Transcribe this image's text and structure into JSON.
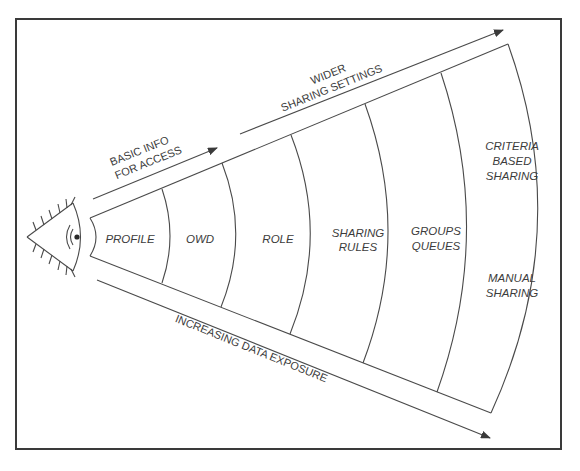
{
  "diagram": {
    "viewer_icon": "eye-icon",
    "top_arrows": [
      {
        "lines": [
          "BASIC INFO",
          "FOR ACCESS"
        ]
      },
      {
        "lines": [
          "WIDER",
          "SHARING SETTINGS"
        ]
      }
    ],
    "bottom_arrow": {
      "label": "INCREASING DATA EXPOSURE"
    },
    "segments": [
      {
        "id": "profile",
        "lines": [
          "PROFILE"
        ]
      },
      {
        "id": "owd",
        "lines": [
          "OWD"
        ]
      },
      {
        "id": "role",
        "lines": [
          "ROLE"
        ]
      },
      {
        "id": "sharing-rules",
        "lines": [
          "SHARING",
          "RULES"
        ]
      },
      {
        "id": "groups-queues",
        "lines": [
          "GROUPS",
          "QUEUES"
        ]
      },
      {
        "id": "criteria-manual",
        "upper_lines": [
          "CRITERIA",
          "BASED",
          "SHARING"
        ],
        "lower_lines": [
          "MANUAL",
          "SHARING"
        ]
      }
    ],
    "colors": {
      "line": "#4a4a4a",
      "text": "#3c3c3c",
      "border": "#3a3a3a",
      "background": "#ffffff"
    }
  }
}
